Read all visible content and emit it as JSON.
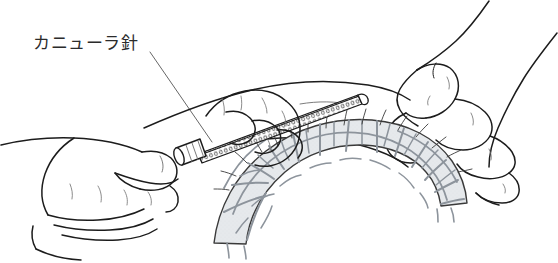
{
  "figure": {
    "kind": "medical-line-illustration",
    "background_color": "#ffffff",
    "width": 558,
    "height": 263
  },
  "annotation": {
    "label": "カニューラ針",
    "label_romaji_meaning": "cannula needle",
    "label_x": 33,
    "label_y": 49,
    "leader_line": {
      "name": "leader-line",
      "from_x": 150,
      "from_y": 52,
      "to_x": 212,
      "to_y": 142,
      "color": "#555555",
      "width": 0.9
    }
  },
  "palette": {
    "outline": "#1c1c1c",
    "outline_soft": "#3a3a3a",
    "hairline": "#6d6d6d",
    "tissue_fill": "#e6e9ec",
    "tissue_border": "#8d949c",
    "needle_body": "#ffffff",
    "needle_hatch": "#3a3a3a",
    "label_color": "#2b2b2b",
    "background": "#ffffff"
  },
  "parts": [
    {
      "name": "left-hand",
      "description": "left hand holding the syringe hub, fingers curled, thumb over barrel"
    },
    {
      "name": "right-hand",
      "description": "right hand pinching and lifting the skin fold"
    },
    {
      "name": "cannula-needle",
      "description": "long hatched cannula shaft angled up to the right with luer hub at lower left"
    },
    {
      "name": "syringe-hub",
      "description": "luer connector barrel at the left end of the cannula"
    },
    {
      "name": "skin-surface",
      "description": "lifted skin fold outline spanning the middle of the figure"
    },
    {
      "name": "fat-tissue-cross-section",
      "description": "arc-shaped cross-section of subcutaneous adipose lobules with septa"
    }
  ]
}
